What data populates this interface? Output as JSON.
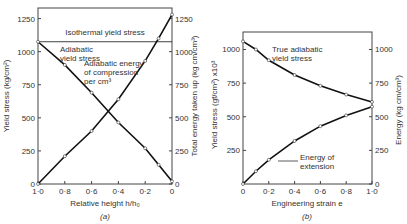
{
  "chart_data": [
    {
      "type": "line",
      "panel_label": "(a)",
      "xlabel": "Relative height h/h₀",
      "ylabel_left": "Yield stress (kg/cm²)",
      "ylabel_right": "Total energy taken up (kg cm/cm³)",
      "x_ticks": [
        "1·0",
        "0·8",
        "0·6",
        "0·4",
        "0·2",
        "0"
      ],
      "y_ticks_left": [
        "0",
        "250",
        "500",
        "750",
        "1000",
        "1250"
      ],
      "y_ticks_right": [
        "0",
        "250",
        "500",
        "750",
        "1000",
        "1250"
      ],
      "xlim": [
        1.0,
        0
      ],
      "ylim": [
        0,
        1330
      ],
      "annotations": [
        "Isothermal yield stress",
        "Adiabatic yield stress",
        "Adiabatic energy of compression per cm³"
      ],
      "series": [
        {
          "name": "Isothermal yield stress",
          "x": [
            1.0,
            0
          ],
          "y": [
            1075,
            1075
          ]
        },
        {
          "name": "Adiabatic yield stress",
          "x": [
            1.0,
            0.8,
            0.6,
            0.4,
            0.2,
            0.1,
            0
          ],
          "y": [
            1075,
            900,
            690,
            465,
            270,
            145,
            20
          ]
        },
        {
          "name": "Adiabatic energy of compression per cm³",
          "x": [
            1.0,
            0.8,
            0.6,
            0.4,
            0.2,
            0.1,
            0
          ],
          "y": [
            0,
            210,
            400,
            640,
            930,
            1100,
            1280
          ]
        }
      ]
    },
    {
      "type": "line",
      "panel_label": "(b)",
      "xlabel": "Engineering strain e",
      "ylabel_left": "Yield stress (gf/cm²) x10³",
      "ylabel_right": "Energy (kg cm/cm³)",
      "x_ticks": [
        "0",
        "0·2",
        "0·4",
        "0·6",
        "0·8",
        "1·0"
      ],
      "y_ticks_left": [
        "250",
        "500",
        "750",
        "1000"
      ],
      "y_ticks_right": [
        "0",
        "250",
        "500",
        "750",
        "1000"
      ],
      "xlim": [
        0,
        1.0
      ],
      "ylim": [
        0,
        1150
      ],
      "annotations": [
        "True adiabatic yield stress",
        "Energy of extension"
      ],
      "series": [
        {
          "name": "True adiabatic yield stress",
          "x": [
            0,
            0.1,
            0.2,
            0.4,
            0.6,
            0.8,
            1.0
          ],
          "y": [
            1060,
            1000,
            920,
            810,
            730,
            665,
            610
          ]
        },
        {
          "name": "Energy of extension",
          "x": [
            0,
            0.1,
            0.2,
            0.4,
            0.6,
            0.8,
            1.0
          ],
          "y": [
            0,
            95,
            180,
            320,
            430,
            510,
            575
          ]
        }
      ]
    }
  ]
}
